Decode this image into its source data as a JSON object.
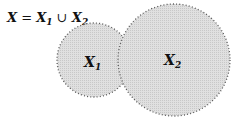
{
  "title": {
    "lhs": "X",
    "eq": " = ",
    "x1": "X",
    "x1_sub": "1",
    "union": " ∪ ",
    "x2": "X",
    "x2_sub": "2"
  },
  "circles": [
    {
      "label": "X",
      "sub": "1",
      "cx": 94,
      "cy": 60,
      "r": 37
    },
    {
      "label": "X",
      "sub": "2",
      "cx": 174,
      "cy": 60,
      "r": 56
    }
  ],
  "colors": {
    "fill": "#d9d9d9",
    "stroke": "#555555"
  }
}
